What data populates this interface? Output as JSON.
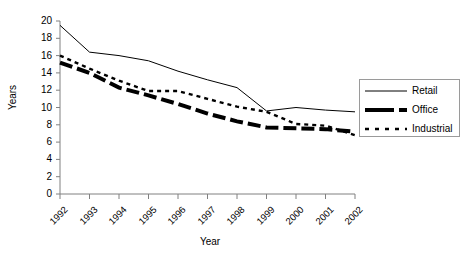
{
  "chart_data": {
    "type": "line",
    "title": "",
    "xlabel": "Year",
    "ylabel": "Years",
    "categories": [
      "1992",
      "1993",
      "1994",
      "1995",
      "1996",
      "1997",
      "1998",
      "1999",
      "2000",
      "2001",
      "2002"
    ],
    "x": [
      1992,
      1993,
      1994,
      1995,
      1996,
      1997,
      1998,
      1999,
      2000,
      2001,
      2002
    ],
    "ylim": [
      0,
      20
    ],
    "yticks": [
      0,
      2,
      4,
      6,
      8,
      10,
      12,
      14,
      16,
      18,
      20
    ],
    "grid": false,
    "legend_position": "right",
    "series": [
      {
        "name": "Retail",
        "style": "solid-thin",
        "values": [
          19.5,
          16.4,
          16.0,
          15.4,
          14.2,
          13.2,
          12.3,
          9.6,
          10.0,
          9.7,
          9.5
        ]
      },
      {
        "name": "Office",
        "style": "thick-dashed",
        "values": [
          15.2,
          14.0,
          12.3,
          11.4,
          10.4,
          9.3,
          8.4,
          7.7,
          7.6,
          7.5,
          7.2
        ]
      },
      {
        "name": "Industrial",
        "style": "dotted",
        "values": [
          16.0,
          14.5,
          13.1,
          11.9,
          11.9,
          11.0,
          10.1,
          9.5,
          8.1,
          7.9,
          6.8
        ]
      }
    ]
  },
  "axis": {
    "y_title": "Years",
    "x_title": "Year",
    "y_tick_labels": [
      "20",
      "18",
      "16",
      "14",
      "12",
      "10",
      "8",
      "6",
      "4",
      "2",
      "0"
    ],
    "x_tick_labels": [
      "1992",
      "1993",
      "1994",
      "1995",
      "1996",
      "1997",
      "1998",
      "1999",
      "2000",
      "2001",
      "2002"
    ]
  },
  "legend": {
    "items": [
      {
        "label": "Retail",
        "swatch": "thin-solid-line-swatch"
      },
      {
        "label": "Office",
        "swatch": "thick-dashed-line-swatch"
      },
      {
        "label": "Industrial",
        "swatch": "dotted-line-swatch"
      }
    ]
  },
  "colors": {
    "line": "#000000",
    "axis": "#808080",
    "background": "#ffffff",
    "legend_border": "#9a9a9a"
  }
}
